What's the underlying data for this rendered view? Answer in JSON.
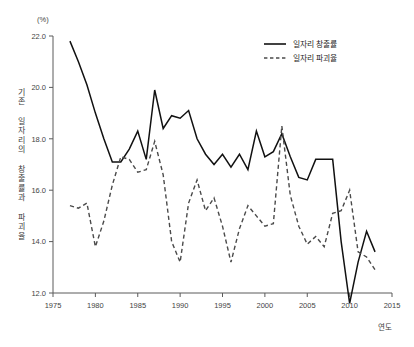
{
  "chart_data": {
    "type": "line",
    "title": "",
    "unit_label": "(%)",
    "xlabel": "연도",
    "ylabel": "기존 일자리의 창출률과 파괴율",
    "xlim": [
      1975,
      2015
    ],
    "ylim": [
      12.0,
      22.0
    ],
    "xticks": [
      1975,
      1980,
      1985,
      1990,
      1995,
      2000,
      2005,
      2010,
      2015
    ],
    "xtick_labels": [
      "1975",
      "1980",
      "1985",
      "1990",
      "1995",
      "2000",
      "2005",
      "2010",
      "2015"
    ],
    "yticks": [
      12.0,
      14.0,
      16.0,
      18.0,
      20.0,
      22.0
    ],
    "ytick_labels": [
      "12.0",
      "14.0",
      "16.0",
      "18.0",
      "20.0",
      "22.0"
    ],
    "grid": false,
    "legend_position": "top-right",
    "x": [
      1977,
      1978,
      1979,
      1980,
      1981,
      1982,
      1983,
      1984,
      1985,
      1986,
      1987,
      1988,
      1989,
      1990,
      1991,
      1992,
      1993,
      1994,
      1995,
      1996,
      1997,
      1998,
      1999,
      2000,
      2001,
      2002,
      2003,
      2004,
      2005,
      2006,
      2007,
      2008,
      2009,
      2010,
      2011,
      2012,
      2013
    ],
    "series": [
      {
        "name": "일자리 창출률",
        "style": "solid",
        "color": "#111111",
        "values": [
          21.8,
          21.0,
          20.1,
          19.0,
          18.0,
          17.1,
          17.1,
          17.6,
          18.3,
          17.2,
          19.9,
          18.4,
          18.9,
          18.8,
          19.1,
          18.0,
          17.4,
          17.0,
          17.4,
          16.9,
          17.4,
          16.8,
          18.3,
          17.3,
          17.5,
          18.2,
          17.3,
          16.5,
          16.4,
          17.2,
          17.2,
          17.2,
          14.0,
          11.6,
          13.2,
          14.4,
          13.6
        ]
      },
      {
        "name": "일자리 파괴율",
        "style": "dashed",
        "color": "#4a4a4a",
        "values": [
          15.4,
          15.3,
          15.5,
          13.8,
          14.8,
          16.2,
          17.3,
          17.2,
          16.7,
          16.8,
          17.9,
          16.6,
          14.0,
          13.2,
          15.5,
          16.4,
          15.2,
          15.7,
          14.6,
          13.2,
          14.5,
          15.4,
          15.0,
          14.6,
          14.7,
          18.5,
          15.8,
          14.6,
          13.9,
          14.2,
          13.8,
          15.1,
          15.2,
          16.0,
          13.6,
          13.4,
          12.9
        ]
      }
    ]
  },
  "legend": {
    "items": [
      {
        "label": "일자리 창출률",
        "style": "solid"
      },
      {
        "label": "일자리 파괴율",
        "style": "dashed"
      }
    ]
  }
}
